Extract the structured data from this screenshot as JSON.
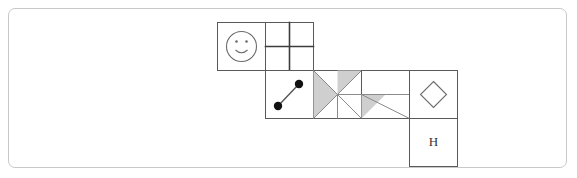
{
  "canvas": {
    "width": 577,
    "height": 178,
    "background_color": "#ffffff",
    "frame": {
      "border_color": "#c9c9c9",
      "corner_radius": 7,
      "x": 8,
      "y": 8,
      "width": 559,
      "height": 160
    }
  },
  "palette": {
    "cell_stroke": "#5a5a5a",
    "divider_stroke": "#3c3c3c",
    "glyph_stroke": "#6b6b6b",
    "shade_fill": "#cfcfcf",
    "dot_fill": "#111111",
    "letter_fill": "#333333"
  },
  "grid": {
    "cell_size": 48,
    "origin_x": 217,
    "origin_y": 22,
    "rows": [
      {
        "row_index": 0,
        "y": 22,
        "cells": [
          {
            "col_index": 0,
            "x": 217,
            "glyph": "smiley-face",
            "label": ""
          },
          {
            "col_index": 1,
            "x": 265,
            "glyph": "quadrant-cross",
            "label": ""
          }
        ]
      },
      {
        "row_index": 1,
        "y": 70,
        "cells": [
          {
            "col_index": 1,
            "x": 265,
            "glyph": "two-dots-link",
            "label": ""
          },
          {
            "col_index": 2,
            "x": 313,
            "glyph": "hourglass-shaded",
            "label": ""
          },
          {
            "col_index": 3,
            "x": 361,
            "glyph": "triangle-shaded",
            "label": ""
          },
          {
            "col_index": 4,
            "x": 409,
            "glyph": "diamond-outline",
            "label": ""
          }
        ]
      },
      {
        "row_index": 2,
        "y": 118,
        "cells": [
          {
            "col_index": 4,
            "x": 409,
            "glyph": "letter",
            "label": "H"
          }
        ]
      }
    ]
  },
  "glyph_geometry": {
    "smiley_face": {
      "circle_radius": 15,
      "eye_radius": 1.3,
      "eye_offset_x": 5,
      "eye_offset_y": 5,
      "smile_sweep": "arc"
    },
    "quadrant_cross": {
      "vertical_split": 0.5,
      "horizontal_split": 0.5
    },
    "two_dots_link": {
      "dot_radius": 4.2,
      "dot_a": {
        "fx": 0.26,
        "fy": 0.74
      },
      "dot_b": {
        "fx": 0.7,
        "fy": 0.28
      }
    },
    "hourglass_shaded": {
      "shaded_sides": [
        "left",
        "right"
      ],
      "note": "two diagonals cross at centre forming bowtie"
    },
    "triangle_shaded": {
      "shaded_sides": [
        "lower-left"
      ],
      "note": "diagonal from top-left to bottom-right with midline"
    },
    "diamond_outline": {
      "half_width": 13,
      "half_height": 13
    }
  },
  "letters": {
    "h_cell": "H"
  }
}
